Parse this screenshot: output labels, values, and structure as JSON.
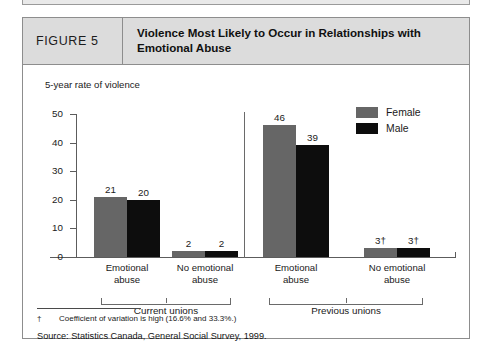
{
  "figure": {
    "number_label": "FIGURE 5",
    "title": "Violence Most Likely to Occur in Relationships with Emotional Abuse"
  },
  "axis": {
    "y_title": "5-year rate of violence"
  },
  "legend": {
    "items": [
      {
        "label": "Female",
        "color": "#666666"
      },
      {
        "label": "Male",
        "color": "#0d0d0d"
      }
    ]
  },
  "groups": [
    {
      "label": "Current unions"
    },
    {
      "label": "Previous unions"
    }
  ],
  "footnotes": {
    "marker": "†",
    "text": "Coefficient of variation is high (16.6% and 33.3%.)",
    "source": "Source:  Statistics Canada, General Social Survey, 1999."
  },
  "chart_data": {
    "type": "bar",
    "title": "Violence Most Likely to Occur in Relationships with Emotional Abuse",
    "xlabel": "",
    "ylabel": "5-year rate of violence",
    "ylim": [
      0,
      50
    ],
    "yticks": [
      0,
      10,
      20,
      30,
      40,
      50
    ],
    "grid": false,
    "legend_position": "top-right",
    "categories": [
      "Emotional abuse",
      "No emotional abuse",
      "Emotional abuse",
      "No emotional abuse"
    ],
    "category_lines": [
      [
        "Emotional",
        "abuse"
      ],
      [
        "No emotional",
        "abuse"
      ],
      [
        "Emotional",
        "abuse"
      ],
      [
        "No emotional",
        "abuse"
      ]
    ],
    "group_of_category": [
      "Current unions",
      "Current unions",
      "Previous unions",
      "Previous unions"
    ],
    "series": [
      {
        "name": "Female",
        "color": "#666666",
        "values": [
          21,
          20,
          46,
          39
        ],
        "labels": [
          "21",
          "20",
          "46",
          "39"
        ]
      },
      {
        "name": "Male",
        "color": "#0d0d0d",
        "values": [
          2,
          2,
          3,
          3
        ],
        "labels": [
          "2",
          "2",
          "3†",
          "3†"
        ]
      }
    ],
    "bars": [
      {
        "category": 0,
        "series": "Female",
        "value": 21,
        "label": "21"
      },
      {
        "category": 0,
        "series": "Male",
        "value": 20,
        "label": "20"
      },
      {
        "category": 1,
        "series": "Female",
        "value": 2,
        "label": "2"
      },
      {
        "category": 1,
        "series": "Male",
        "value": 2,
        "label": "2"
      },
      {
        "category": 2,
        "series": "Female",
        "value": 46,
        "label": "46"
      },
      {
        "category": 2,
        "series": "Male",
        "value": 39,
        "label": "39"
      },
      {
        "category": 3,
        "series": "Female",
        "value": 3,
        "label": "3†"
      },
      {
        "category": 3,
        "series": "Male",
        "value": 3,
        "label": "3†"
      }
    ],
    "annotations": [
      "† Coefficient of variation is high (16.6% and 33.3%.)"
    ]
  }
}
